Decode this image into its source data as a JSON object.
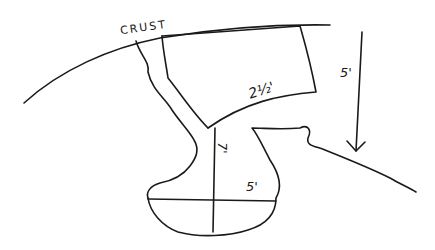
{
  "diagram": {
    "style": "hand-drawn ink sketch",
    "ink_color": "#1a1a1a",
    "background": "#ffffff",
    "labels": {
      "crust": "CRUST",
      "span": "2½'",
      "depth": "5'",
      "height": "7'",
      "width": "5'"
    },
    "elements": [
      {
        "name": "crust-surface-arc",
        "description": "curved ground surface line"
      },
      {
        "name": "upper-slab",
        "description": "curved slab hanging from crust, labeled 2½'"
      },
      {
        "name": "shaft",
        "description": "narrow passage descending from crust"
      },
      {
        "name": "chamber",
        "description": "rounded chamber at bottom with crosshair measurements"
      },
      {
        "name": "right-ledge",
        "description": "irregular ledge extending right"
      },
      {
        "name": "depth-arrow",
        "description": "downward arrow labeled 5'"
      }
    ]
  }
}
